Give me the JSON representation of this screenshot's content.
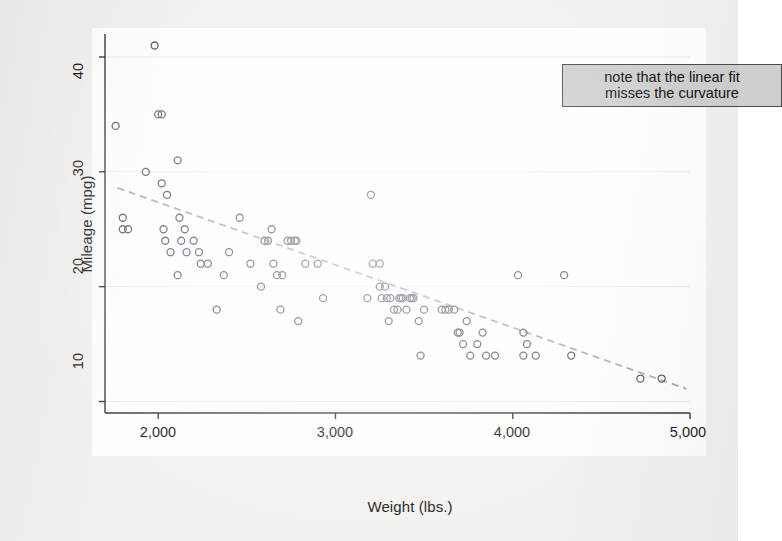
{
  "chart_data": {
    "type": "scatter",
    "title": "",
    "xlabel": "Weight (lbs.)",
    "ylabel": "Mileage (mpg)",
    "xlim": [
      1700,
      5000
    ],
    "ylim": [
      9,
      42
    ],
    "xticks": [
      2000,
      3000,
      4000,
      5000
    ],
    "xtick_labels": [
      "2,000",
      "3,000",
      "4,000",
      "5,000"
    ],
    "yticks": [
      10,
      20,
      30,
      40
    ],
    "ytick_labels": [
      "10",
      "20",
      "30",
      "40"
    ],
    "grid": "horizontal-faint",
    "legend": "none",
    "marker": {
      "shape": "circle",
      "filled": false,
      "edge_color": "#555f6e",
      "size": 7
    },
    "points": [
      [
        1760,
        34
      ],
      [
        1800,
        26
      ],
      [
        1800,
        25
      ],
      [
        1830,
        25
      ],
      [
        1930,
        30
      ],
      [
        1980,
        41
      ],
      [
        2000,
        35
      ],
      [
        2020,
        35
      ],
      [
        2020,
        29
      ],
      [
        2030,
        25
      ],
      [
        2040,
        24
      ],
      [
        2050,
        28
      ],
      [
        2070,
        23
      ],
      [
        2110,
        31
      ],
      [
        2110,
        21
      ],
      [
        2120,
        26
      ],
      [
        2130,
        24
      ],
      [
        2150,
        25
      ],
      [
        2160,
        23
      ],
      [
        2200,
        24
      ],
      [
        2230,
        23
      ],
      [
        2240,
        22
      ],
      [
        2280,
        22
      ],
      [
        2330,
        18
      ],
      [
        2370,
        21
      ],
      [
        2400,
        23
      ],
      [
        2460,
        26
      ],
      [
        2520,
        22
      ],
      [
        2580,
        20
      ],
      [
        2600,
        24
      ],
      [
        2620,
        24
      ],
      [
        2640,
        25
      ],
      [
        2650,
        22
      ],
      [
        2670,
        21
      ],
      [
        2690,
        18
      ],
      [
        2700,
        21
      ],
      [
        2730,
        24
      ],
      [
        2750,
        24
      ],
      [
        2770,
        24
      ],
      [
        2780,
        24
      ],
      [
        2790,
        17
      ],
      [
        2830,
        22
      ],
      [
        2900,
        22
      ],
      [
        2930,
        19
      ],
      [
        3180,
        19
      ],
      [
        3200,
        28
      ],
      [
        3210,
        22
      ],
      [
        3250,
        22
      ],
      [
        3250,
        20
      ],
      [
        3260,
        19
      ],
      [
        3280,
        20
      ],
      [
        3290,
        19
      ],
      [
        3300,
        17
      ],
      [
        3310,
        19
      ],
      [
        3330,
        18
      ],
      [
        3350,
        18
      ],
      [
        3360,
        19
      ],
      [
        3370,
        19
      ],
      [
        3380,
        19
      ],
      [
        3400,
        18
      ],
      [
        3420,
        19
      ],
      [
        3430,
        19
      ],
      [
        3440,
        19
      ],
      [
        3470,
        17
      ],
      [
        3480,
        14
      ],
      [
        3500,
        18
      ],
      [
        3600,
        18
      ],
      [
        3620,
        18
      ],
      [
        3640,
        18
      ],
      [
        3670,
        18
      ],
      [
        3690,
        16
      ],
      [
        3700,
        16
      ],
      [
        3720,
        15
      ],
      [
        3740,
        17
      ],
      [
        3760,
        14
      ],
      [
        3800,
        15
      ],
      [
        3830,
        16
      ],
      [
        3850,
        14
      ],
      [
        3900,
        14
      ],
      [
        4030,
        21
      ],
      [
        4060,
        16
      ],
      [
        4060,
        14
      ],
      [
        4080,
        15
      ],
      [
        4130,
        14
      ],
      [
        4290,
        21
      ],
      [
        4330,
        14
      ],
      [
        4720,
        12
      ],
      [
        4840,
        12
      ]
    ],
    "fit_line": {
      "type": "linear",
      "style": "dashed",
      "color": "#a7a9ac",
      "x_start": 1770,
      "y_start": 28.6,
      "x_end": 4980,
      "y_end": 11.1,
      "note": "linear regression of mileage on weight"
    },
    "annotation": {
      "line1": "note that the linear fit",
      "line2": "misses the curvature",
      "background": "#cfcfcf",
      "border": "#4a4a4a"
    }
  },
  "axes": {
    "y_title": "Mileage (mpg)",
    "x_title": "Weight (lbs.)",
    "ytick_labels": [
      "40",
      "30",
      "20",
      "10"
    ],
    "xtick_labels": [
      "2,000",
      "3,000",
      "4,000",
      "5,000"
    ]
  },
  "colors": {
    "page_background": "#f2f1ef",
    "plot_background": "#fefefe",
    "axis": "#3a3a3a",
    "marker_edge": "#555f6e",
    "fit_line": "#a7a9ac",
    "gridline": "#eceaea",
    "annotation_fill": "#cfcfcf",
    "annotation_border": "#4a4a4a"
  }
}
